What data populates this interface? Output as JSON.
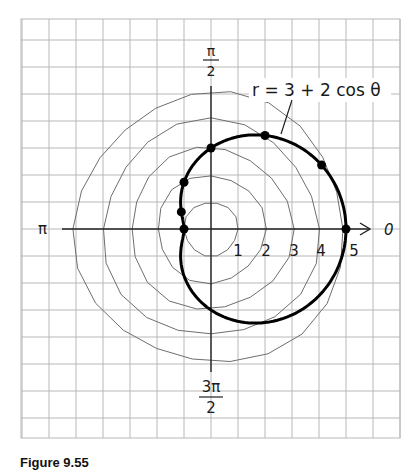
{
  "chart_data": {
    "type": "line",
    "subtype": "polar",
    "title": "r = 3 + 2 cos θ",
    "equation": "r = 3 + 2cos(θ)",
    "curve_label": "r = 3 + 2 cos θ",
    "angle_labels": {
      "right": "0",
      "top_numerator": "π",
      "top_denominator": "2",
      "left": "π",
      "bottom_numerator": "3π",
      "bottom_denominator": "2"
    },
    "radial_ticks": [
      "1",
      "2",
      "3",
      "4",
      "5"
    ],
    "radial_circles": [
      1,
      2,
      3,
      4,
      5
    ],
    "rlim": [
      0,
      5
    ],
    "grid": true,
    "plotted_points": [
      {
        "theta": "0",
        "theta_rad": 0,
        "r": 5
      },
      {
        "theta": "π/6",
        "theta_rad": 0.5236,
        "r": 4.73
      },
      {
        "theta": "π/3",
        "theta_rad": 1.0472,
        "r": 4
      },
      {
        "theta": "π/2",
        "theta_rad": 1.5708,
        "r": 3
      },
      {
        "theta": "2π/3",
        "theta_rad": 2.0944,
        "r": 2
      },
      {
        "theta": "5π/6",
        "theta_rad": 2.618,
        "r": 1.27
      },
      {
        "theta": "π",
        "theta_rad": 3.1416,
        "r": 1
      }
    ]
  },
  "caption": "Figure 9.55",
  "colors": {
    "grid": "#b8b8b8",
    "circles": "#6e6e6e",
    "axes": "#222222",
    "curve": "#000000",
    "background": "#ffffff"
  }
}
